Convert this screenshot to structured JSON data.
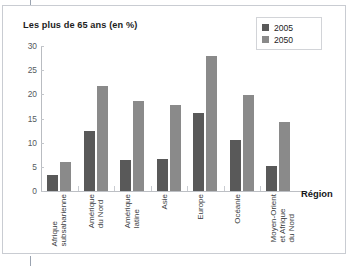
{
  "figure": {
    "title": "Les plus de 65 ans (en %)",
    "axis_x_title": "Région",
    "colors": {
      "series_2005": "#595959",
      "series_2050": "#8a8a8a",
      "frame": "#c9ccd2",
      "axis": "#bcbfc4",
      "text": "#1d1d1d"
    }
  },
  "legend": {
    "items": [
      {
        "label": "2005",
        "color": "#595959",
        "swatch_icon": "square-swatch-icon"
      },
      {
        "label": "2050",
        "color": "#8a8a8a",
        "swatch_icon": "square-swatch-icon"
      }
    ]
  },
  "chart_data": {
    "type": "bar",
    "title": "Les plus de 65 ans (en %)",
    "xlabel": "Région",
    "ylabel": "",
    "ylim": [
      0,
      30
    ],
    "yticks": [
      0,
      5,
      10,
      15,
      20,
      25,
      30
    ],
    "ytick_labels": [
      "0",
      "5",
      "10",
      "15",
      "20",
      "25",
      "30"
    ],
    "grid": false,
    "legend_position": "top-right",
    "categories": [
      "Afrique subsaharienne",
      "Amérique du Nord",
      "Amérique latine",
      "Asie",
      "Europe",
      "Océanie",
      "Moyen-Orient et Afrique du Nord"
    ],
    "category_lines": [
      [
        "Afrique",
        "subsaharienne"
      ],
      [
        "Amérique",
        "du Nord"
      ],
      [
        "Amérique",
        "latine"
      ],
      [
        "Asie"
      ],
      [
        "Europe"
      ],
      [
        "Océanie"
      ],
      [
        "Moyen-Orient",
        "et Afrique",
        "du Nord"
      ]
    ],
    "series": [
      {
        "name": "2005",
        "color": "#595959",
        "values": [
          3.4,
          12.4,
          6.5,
          6.7,
          16.2,
          10.6,
          5.2
        ]
      },
      {
        "name": "2050",
        "color": "#8a8a8a",
        "values": [
          5.9,
          21.7,
          18.7,
          17.7,
          27.9,
          19.9,
          14.2
        ]
      }
    ]
  }
}
